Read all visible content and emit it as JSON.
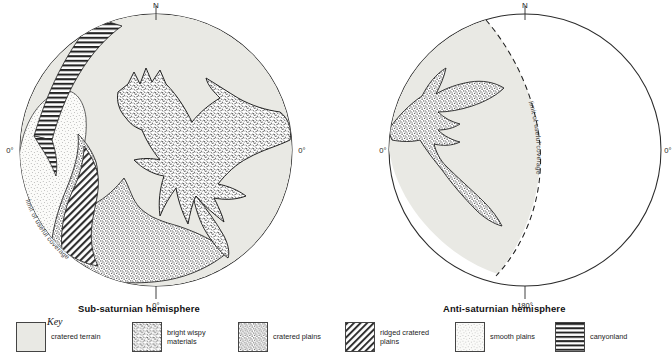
{
  "figure": {
    "maps": [
      {
        "id": "sub-saturnian",
        "title": "Sub-saturnian hemisphere",
        "north_label": "N",
        "left_label": "0°",
        "right_label": "0°",
        "bottom_label": "0°",
        "coverage_label": "limit of useful coverage"
      },
      {
        "id": "anti-saturnian",
        "title": "Anti-saturnian hemisphere",
        "north_label": "N",
        "left_label": "0°",
        "right_label": "0°",
        "bottom_label": "180°",
        "coverage_label": "limit of useful coverage"
      }
    ]
  },
  "key": {
    "heading": "Key",
    "items": [
      {
        "label": "cratered terrain",
        "pattern": "plain-grey",
        "fill": "#e9e9e4"
      },
      {
        "label": "bright wispy materials",
        "pattern": "wispy-speckle",
        "fill": "#ffffff"
      },
      {
        "label": "cratered plains",
        "pattern": "dense-stipple",
        "fill": "#ffffff"
      },
      {
        "label": "ridged cratered plains",
        "pattern": "diagonal-hatch",
        "fill": "#ffffff"
      },
      {
        "label": "smooth plains",
        "pattern": "light-stipple",
        "fill": "#ffffff"
      },
      {
        "label": "canyonland",
        "pattern": "horizontal-lines",
        "fill": "#ffffff"
      }
    ]
  },
  "colors": {
    "cratered_terrain": "#e9e9e4",
    "outline": "#2b2b2b",
    "text": "#1a1a1a"
  }
}
